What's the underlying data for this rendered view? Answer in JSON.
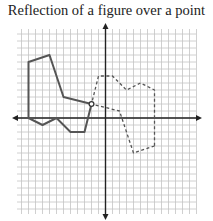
{
  "title": "Reflection of a figure over a point",
  "chart_data": {
    "type": "diagram",
    "title": "Reflection of a figure over a point",
    "grid": true,
    "axes": {
      "x_range": [
        -13,
        13
      ],
      "y_range": [
        -13,
        13
      ]
    },
    "center_of_reflection": [
      -2,
      2
    ],
    "original_figure": {
      "style": "solid",
      "points": [
        [
          -11,
          8
        ],
        [
          -8,
          9
        ],
        [
          -6,
          3
        ],
        [
          -2,
          2
        ],
        [
          -3,
          -2
        ],
        [
          -5,
          -2
        ],
        [
          -7,
          0
        ],
        [
          -9,
          -1
        ],
        [
          -11,
          0
        ]
      ]
    },
    "reflected_figure": {
      "style": "dashed",
      "points": [
        [
          7,
          -4
        ],
        [
          4,
          -5
        ],
        [
          2,
          1
        ],
        [
          -2,
          2
        ],
        [
          -1,
          6
        ],
        [
          1,
          6
        ],
        [
          3,
          4
        ],
        [
          5,
          5
        ],
        [
          7,
          4
        ]
      ]
    },
    "colors": {
      "grid": "#b8b8b8",
      "axis": "#222222",
      "figure": "#555555"
    }
  }
}
